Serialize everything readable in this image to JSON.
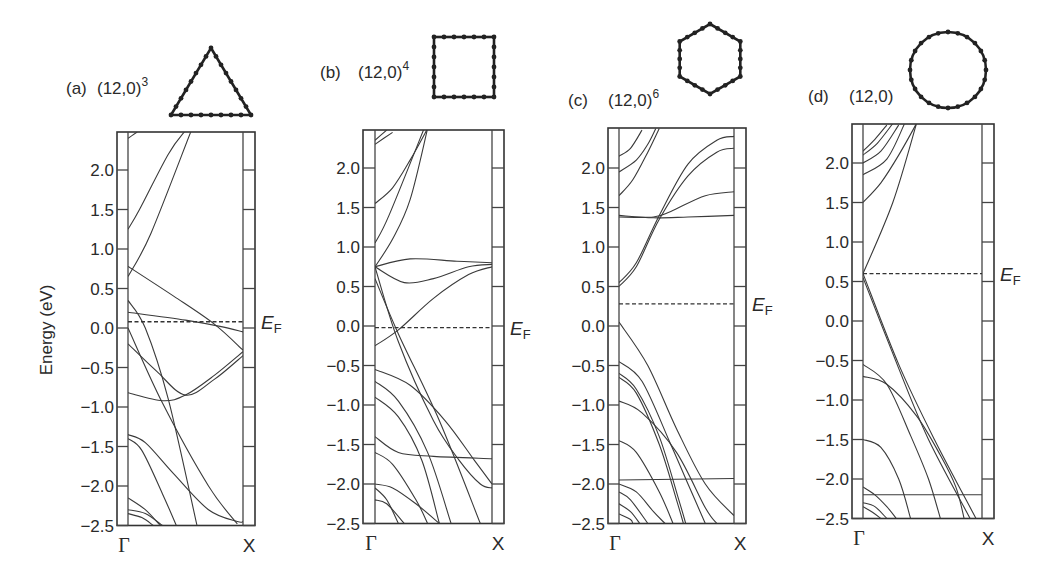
{
  "chart_data": {
    "type": "line",
    "ylabel": "Energy (eV)",
    "xlabel": "",
    "ylim": [
      -2.5,
      2.5
    ],
    "yticks": [
      "2.0",
      "1.5",
      "1.0",
      "0.5",
      "0.0",
      "−0.5",
      "−1.0",
      "−1.5",
      "−2.0",
      "−2.5"
    ],
    "ytick_values": [
      2.0,
      1.5,
      1.0,
      0.5,
      0.0,
      -0.5,
      -1.0,
      -1.5,
      -2.0,
      -2.5
    ],
    "x_ticks": [
      "Γ",
      "X"
    ],
    "fermi_label": "E",
    "fermi_sub": "F",
    "panels": [
      {
        "label": "(a)",
        "tube": "(12,0)",
        "superscript": "3",
        "cross_section": "triangle",
        "fermi_level": 0.08,
        "bands": [
          [
            [
              0,
              2.4
            ],
            [
              0.08,
              2.48
            ]
          ],
          [
            [
              0,
              1.25
            ],
            [
              0.1,
              1.5
            ],
            [
              0.35,
              2.2
            ],
            [
              0.5,
              2.5
            ]
          ],
          [
            [
              0,
              0.65
            ],
            [
              0.2,
              1.2
            ],
            [
              0.55,
              2.5
            ]
          ],
          [
            [
              0,
              0.78
            ],
            [
              0.4,
              0.4
            ],
            [
              0.75,
              0.05
            ],
            [
              1,
              -0.28
            ]
          ],
          [
            [
              0,
              0.2
            ],
            [
              0.5,
              0.1
            ],
            [
              0.8,
              0.02
            ],
            [
              1,
              -0.05
            ]
          ],
          [
            [
              0,
              0.35
            ],
            [
              0.15,
              0.0
            ],
            [
              0.35,
              -0.9
            ],
            [
              0.6,
              -2.5
            ]
          ],
          [
            [
              0,
              -0.2
            ],
            [
              0.25,
              -0.55
            ],
            [
              0.5,
              -0.85
            ],
            [
              0.75,
              -0.65
            ],
            [
              1,
              -0.35
            ]
          ],
          [
            [
              0,
              -0.82
            ],
            [
              0.3,
              -0.92
            ],
            [
              0.5,
              -0.85
            ],
            [
              0.75,
              -0.6
            ],
            [
              1,
              -0.3
            ]
          ],
          [
            [
              0,
              0.0
            ],
            [
              0.3,
              -0.95
            ],
            [
              0.7,
              -2.0
            ],
            [
              0.95,
              -2.48
            ]
          ],
          [
            [
              0,
              -1.35
            ],
            [
              0.15,
              -1.45
            ],
            [
              0.4,
              -1.85
            ],
            [
              0.7,
              -2.3
            ],
            [
              0.95,
              -2.45
            ],
            [
              1,
              -2.45
            ]
          ],
          [
            [
              0,
              -1.4
            ],
            [
              0.12,
              -1.55
            ],
            [
              0.3,
              -2.1
            ],
            [
              0.42,
              -2.5
            ]
          ],
          [
            [
              0,
              -2.15
            ],
            [
              0.15,
              -2.3
            ],
            [
              0.28,
              -2.5
            ]
          ],
          [
            [
              0,
              -2.3
            ],
            [
              0.15,
              -2.35
            ],
            [
              0.3,
              -2.5
            ]
          ],
          [
            [
              0,
              -2.35
            ],
            [
              0.12,
              -2.4
            ],
            [
              0.22,
              -2.5
            ]
          ]
        ]
      },
      {
        "label": "(b)",
        "tube": "(12,0)",
        "superscript": "4",
        "cross_section": "square",
        "fermi_level": -0.02,
        "bands": [
          [
            [
              0,
              2.35
            ],
            [
              0.1,
              2.48
            ]
          ],
          [
            [
              0,
              2.3
            ],
            [
              0.15,
              2.45
            ]
          ],
          [
            [
              0,
              1.55
            ],
            [
              0.15,
              1.75
            ],
            [
              0.3,
              2.1
            ],
            [
              0.45,
              2.5
            ]
          ],
          [
            [
              0,
              1.05
            ],
            [
              0.12,
              1.4
            ],
            [
              0.42,
              2.5
            ]
          ],
          [
            [
              0,
              0.75
            ],
            [
              0.15,
              1.1
            ],
            [
              0.3,
              1.6
            ],
            [
              0.45,
              2.5
            ]
          ],
          [
            [
              0,
              0.75
            ],
            [
              0.3,
              0.85
            ],
            [
              0.7,
              0.82
            ],
            [
              1,
              0.8
            ]
          ],
          [
            [
              0,
              0.75
            ],
            [
              0.25,
              0.55
            ],
            [
              0.5,
              0.6
            ],
            [
              0.8,
              0.75
            ],
            [
              1,
              0.78
            ]
          ],
          [
            [
              0,
              -0.25
            ],
            [
              0.2,
              -0.05
            ],
            [
              0.5,
              0.35
            ],
            [
              0.8,
              0.65
            ],
            [
              1,
              0.75
            ]
          ],
          [
            [
              0,
              0.75
            ],
            [
              0.2,
              -0.2
            ],
            [
              0.5,
              -1.2
            ],
            [
              0.72,
              -1.7
            ],
            [
              0.9,
              -2.0
            ],
            [
              1,
              -2.05
            ]
          ],
          [
            [
              0,
              0.6
            ],
            [
              0.2,
              -0.1
            ],
            [
              0.55,
              -1.2
            ],
            [
              0.9,
              -2.5
            ]
          ],
          [
            [
              0,
              -0.55
            ],
            [
              0.3,
              -0.75
            ],
            [
              0.6,
              -1.2
            ],
            [
              0.85,
              -1.7
            ],
            [
              1,
              -2.0
            ]
          ],
          [
            [
              0,
              -0.7
            ],
            [
              0.2,
              -0.95
            ],
            [
              0.45,
              -1.6
            ],
            [
              0.65,
              -2.5
            ]
          ],
          [
            [
              0,
              -0.9
            ],
            [
              0.2,
              -1.15
            ],
            [
              0.4,
              -1.7
            ],
            [
              0.55,
              -2.5
            ]
          ],
          [
            [
              0,
              -1.4
            ],
            [
              0.2,
              -1.6
            ],
            [
              0.5,
              -1.65
            ],
            [
              1,
              -1.68
            ]
          ],
          [
            [
              0,
              -1.6
            ],
            [
              0.15,
              -1.75
            ],
            [
              0.35,
              -2.2
            ],
            [
              0.45,
              -2.5
            ]
          ],
          [
            [
              0,
              -2.0
            ],
            [
              0.15,
              -2.05
            ],
            [
              0.35,
              -2.25
            ],
            [
              0.55,
              -2.5
            ]
          ],
          [
            [
              0,
              -2.2
            ],
            [
              0.1,
              -2.25
            ],
            [
              0.25,
              -2.5
            ]
          ],
          [
            [
              0,
              -2.05
            ],
            [
              0.1,
              -2.2
            ],
            [
              0.2,
              -2.5
            ]
          ]
        ]
      },
      {
        "label": "(c)",
        "tube": "(12,0)",
        "superscript": "6",
        "cross_section": "hexagon",
        "fermi_level": 0.28,
        "bands": [
          [
            [
              0,
              2.15
            ],
            [
              0.1,
              2.25
            ],
            [
              0.2,
              2.48
            ]
          ],
          [
            [
              0,
              1.95
            ],
            [
              0.15,
              2.1
            ],
            [
              0.25,
              2.3
            ],
            [
              0.32,
              2.5
            ]
          ],
          [
            [
              0,
              1.65
            ],
            [
              0.12,
              1.85
            ],
            [
              0.25,
              2.2
            ],
            [
              0.35,
              2.5
            ]
          ],
          [
            [
              0,
              1.4
            ],
            [
              0.3,
              1.37
            ],
            [
              0.6,
              1.38
            ],
            [
              1,
              1.4
            ]
          ],
          [
            [
              0,
              0.5
            ],
            [
              0.15,
              0.75
            ],
            [
              0.35,
              1.35
            ],
            [
              0.6,
              1.9
            ],
            [
              0.85,
              2.2
            ],
            [
              1,
              2.25
            ]
          ],
          [
            [
              0,
              0.55
            ],
            [
              0.15,
              0.8
            ],
            [
              0.35,
              1.4
            ],
            [
              0.6,
              2.05
            ],
            [
              0.85,
              2.35
            ],
            [
              1,
              2.4
            ]
          ],
          [
            [
              0,
              1.38
            ],
            [
              0.3,
              1.38
            ],
            [
              0.45,
              1.45
            ],
            [
              0.75,
              1.65
            ],
            [
              1,
              1.7
            ]
          ],
          [
            [
              0,
              0.05
            ],
            [
              0.25,
              -0.5
            ],
            [
              0.5,
              -1.3
            ],
            [
              0.75,
              -2.0
            ],
            [
              1,
              -2.4
            ]
          ],
          [
            [
              0,
              -0.45
            ],
            [
              0.2,
              -0.7
            ],
            [
              0.45,
              -1.5
            ],
            [
              0.6,
              -2.0
            ],
            [
              0.75,
              -2.5
            ]
          ],
          [
            [
              0,
              -0.6
            ],
            [
              0.15,
              -0.8
            ],
            [
              0.35,
              -1.4
            ],
            [
              0.52,
              -2.2
            ],
            [
              0.58,
              -2.5
            ]
          ],
          [
            [
              0,
              -0.65
            ],
            [
              0.15,
              -0.85
            ],
            [
              0.35,
              -1.5
            ],
            [
              0.5,
              -2.2
            ],
            [
              0.56,
              -2.5
            ]
          ],
          [
            [
              0,
              -0.95
            ],
            [
              0.2,
              -1.1
            ],
            [
              0.5,
              -1.6
            ],
            [
              0.75,
              -2.3
            ],
            [
              0.85,
              -2.5
            ]
          ],
          [
            [
              0,
              -1.45
            ],
            [
              0.15,
              -1.6
            ],
            [
              0.35,
              -2.1
            ],
            [
              0.47,
              -2.5
            ]
          ],
          [
            [
              0,
              -1.95
            ],
            [
              1,
              -1.93
            ]
          ],
          [
            [
              0,
              -2.0
            ],
            [
              0.15,
              -2.1
            ],
            [
              0.3,
              -2.35
            ],
            [
              0.4,
              -2.5
            ]
          ],
          [
            [
              0,
              -2.1
            ],
            [
              0.1,
              -2.2
            ],
            [
              0.25,
              -2.5
            ]
          ],
          [
            [
              0,
              -2.25
            ],
            [
              0.1,
              -2.35
            ],
            [
              0.18,
              -2.5
            ]
          ],
          [
            [
              0,
              -2.38
            ],
            [
              0.1,
              -2.45
            ],
            [
              0.12,
              -2.5
            ]
          ]
        ]
      },
      {
        "label": "(d)",
        "tube": "(12,0)",
        "superscript": "",
        "cross_section": "circle",
        "fermi_level": 0.6,
        "bands": [
          [
            [
              0,
              2.15
            ],
            [
              0.1,
              2.3
            ],
            [
              0.2,
              2.48
            ]
          ],
          [
            [
              0,
              2.1
            ],
            [
              0.12,
              2.25
            ],
            [
              0.25,
              2.5
            ]
          ],
          [
            [
              0,
              2.0
            ],
            [
              0.15,
              2.15
            ],
            [
              0.3,
              2.48
            ]
          ],
          [
            [
              0,
              1.85
            ],
            [
              0.2,
              2.05
            ],
            [
              0.35,
              2.5
            ]
          ],
          [
            [
              0,
              1.5
            ],
            [
              0.15,
              1.75
            ],
            [
              0.3,
              2.1
            ],
            [
              0.45,
              2.5
            ]
          ],
          [
            [
              0,
              0.6
            ],
            [
              0.25,
              1.5
            ],
            [
              0.45,
              2.5
            ]
          ],
          [
            [
              0,
              0.6
            ],
            [
              0.3,
              -0.55
            ],
            [
              0.6,
              -1.5
            ],
            [
              0.95,
              -2.5
            ]
          ],
          [
            [
              0,
              0.55
            ],
            [
              0.3,
              -0.6
            ],
            [
              0.55,
              -1.5
            ],
            [
              0.9,
              -2.5
            ]
          ],
          [
            [
              0,
              -0.55
            ],
            [
              0.2,
              -0.8
            ],
            [
              0.4,
              -1.45
            ],
            [
              0.55,
              -2.0
            ],
            [
              0.65,
              -2.5
            ]
          ],
          [
            [
              0,
              -0.7
            ],
            [
              0.2,
              -0.8
            ],
            [
              0.45,
              -1.2
            ],
            [
              0.65,
              -1.7
            ],
            [
              0.78,
              -2.1
            ],
            [
              0.85,
              -2.5
            ]
          ],
          [
            [
              0,
              -1.5
            ],
            [
              0.15,
              -1.6
            ],
            [
              0.3,
              -2.0
            ],
            [
              0.4,
              -2.5
            ]
          ],
          [
            [
              0,
              -2.1
            ],
            [
              0.1,
              -2.2
            ],
            [
              0.2,
              -2.35
            ],
            [
              0.28,
              -2.5
            ]
          ],
          [
            [
              0,
              -2.2
            ],
            [
              1,
              -2.2
            ]
          ],
          [
            [
              0,
              -2.3
            ],
            [
              0.1,
              -2.35
            ],
            [
              0.2,
              -2.5
            ]
          ],
          [
            [
              0,
              -2.35
            ],
            [
              0.08,
              -2.42
            ],
            [
              0.15,
              -2.5
            ]
          ]
        ]
      }
    ]
  }
}
